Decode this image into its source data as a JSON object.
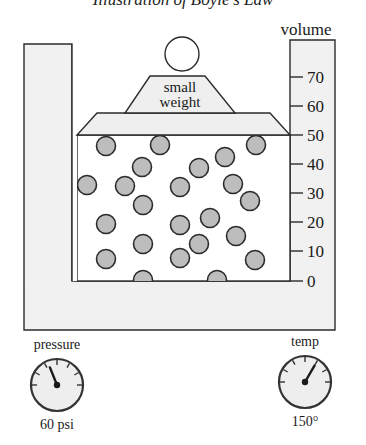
{
  "title": "Illustration of Boyle's Law",
  "colors": {
    "container_fill": "#f1f1f1",
    "chamber_fill": "#ffffff",
    "piston_fill": "#efefef",
    "particle_fill": "#bdbdbd",
    "stroke": "#2b2b2b",
    "gauge_fill": "#eeeeee"
  },
  "volume_scale": {
    "label": "volume",
    "ticks": [
      {
        "value": "70",
        "y": 77
      },
      {
        "value": "60",
        "y": 106
      },
      {
        "value": "50",
        "y": 135
      },
      {
        "value": "40",
        "y": 164
      },
      {
        "value": "30",
        "y": 193
      },
      {
        "value": "20",
        "y": 222
      },
      {
        "value": "10",
        "y": 251
      },
      {
        "value": "0",
        "y": 281
      }
    ],
    "current_reading": "50"
  },
  "weight": {
    "label_line1": "small",
    "label_line2": "weight"
  },
  "particles": [
    {
      "cx": 106,
      "cy": 146
    },
    {
      "cx": 160,
      "cy": 145
    },
    {
      "cx": 256,
      "cy": 145
    },
    {
      "cx": 225,
      "cy": 157
    },
    {
      "cx": 142,
      "cy": 167
    },
    {
      "cx": 199,
      "cy": 168
    },
    {
      "cx": 87,
      "cy": 185
    },
    {
      "cx": 125,
      "cy": 186
    },
    {
      "cx": 180,
      "cy": 187
    },
    {
      "cx": 233,
      "cy": 184
    },
    {
      "cx": 143,
      "cy": 205
    },
    {
      "cx": 250,
      "cy": 201
    },
    {
      "cx": 106,
      "cy": 224
    },
    {
      "cx": 180,
      "cy": 225
    },
    {
      "cx": 210,
      "cy": 218
    },
    {
      "cx": 143,
      "cy": 244
    },
    {
      "cx": 199,
      "cy": 244
    },
    {
      "cx": 236,
      "cy": 236
    },
    {
      "cx": 106,
      "cy": 259
    },
    {
      "cx": 180,
      "cy": 258
    },
    {
      "cx": 255,
      "cy": 260
    },
    {
      "cx": 143,
      "cy": 280
    },
    {
      "cx": 217,
      "cy": 280
    }
  ],
  "gauges": {
    "pressure": {
      "label": "pressure",
      "value": "60 psi",
      "needle_angle_deg": -22
    },
    "temp": {
      "label": "temp",
      "value": "150°",
      "needle_angle_deg": 30
    }
  }
}
